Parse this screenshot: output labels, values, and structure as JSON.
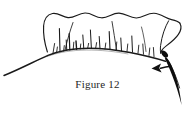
{
  "figure": {
    "caption": "Figure 12",
    "title": "Figure 12",
    "kind": "line-art-illustration",
    "background_color": "#ffffff",
    "ink_color": "#1a1a1a",
    "canvas": {
      "width": 191,
      "height": 120
    },
    "elements": {
      "scalloped_flap": {
        "name": "scalloped-flap-outline",
        "description": "Wavy scalloped upper edge of a flap with two vertical fold lines and a closed right end",
        "stroke_color": "#1a1a1a",
        "fill_color": "#ffffff",
        "wave_peaks": 4
      },
      "baseline_curve": {
        "name": "baseline-curve",
        "description": "Long sweeping curve running from lower-left up to the right edge forming the base line",
        "stroke_color": "#1a1a1a"
      },
      "bristles": {
        "name": "bristle-strokes",
        "description": "Short vertical hair-like strokes rising from the baseline curve",
        "count": 20,
        "stroke_color": "#1a1a1a"
      },
      "arrow": {
        "name": "direction-arrow",
        "description": "Solid black arrow pointing left, indicating direction of motion",
        "direction": "left",
        "fill_color": "#111111"
      },
      "blade": {
        "name": "blade-spike",
        "description": "Dark tapered curved blade or needle shape descending at the right side",
        "fill_color": "#0d0d0d"
      }
    }
  }
}
